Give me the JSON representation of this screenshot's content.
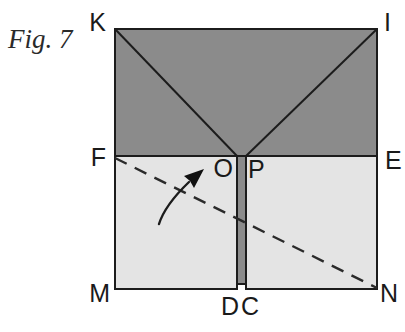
{
  "figure": {
    "caption": "Fig. 7"
  },
  "labels": {
    "K": "K",
    "I": "I",
    "F": "F",
    "O": "O",
    "P": "P",
    "E": "E",
    "M": "M",
    "D": "D",
    "C": "C",
    "N": "N"
  },
  "colors": {
    "dark_gray": "#8b8b8b",
    "light_gray": "#e4e4e4",
    "line": "#1c1c1c",
    "background": "#ffffff"
  }
}
